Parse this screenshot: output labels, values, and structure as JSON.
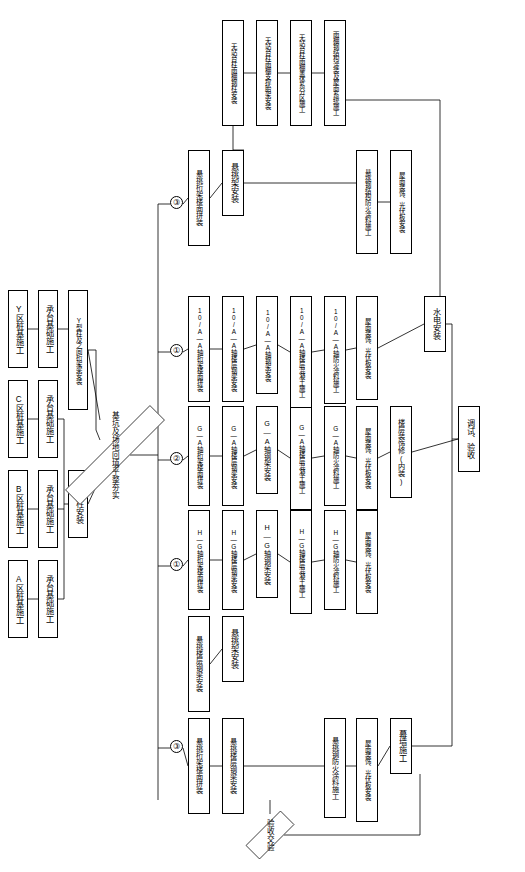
{
  "diagram": {
    "nodes": [
      {
        "id": "n1",
        "label": "A区桩基施工",
        "x": 8,
        "y": 560,
        "w": 20,
        "h": 78
      },
      {
        "id": "n2",
        "label": "承台基础施工",
        "x": 38,
        "y": 560,
        "w": 20,
        "h": 78
      },
      {
        "id": "n3",
        "label": "B区桩基施工",
        "x": 8,
        "y": 470,
        "w": 20,
        "h": 78
      },
      {
        "id": "n4",
        "label": "承台基础施工",
        "x": 38,
        "y": 470,
        "w": 20,
        "h": 78
      },
      {
        "id": "n5",
        "label": "C区桩基施工",
        "x": 8,
        "y": 380,
        "w": 20,
        "h": 78
      },
      {
        "id": "n6",
        "label": "承台基础施工",
        "x": 38,
        "y": 380,
        "w": 20,
        "h": 78
      },
      {
        "id": "n7",
        "label": "Y区桩基施工",
        "x": 8,
        "y": 290,
        "w": 20,
        "h": 78
      },
      {
        "id": "n8",
        "label": "承台基础施工",
        "x": 38,
        "y": 290,
        "w": 20,
        "h": 78
      },
      {
        "id": "n9",
        "label": "钢管柱安装",
        "x": 68,
        "y": 470,
        "w": 20,
        "h": 68
      },
      {
        "id": "n10",
        "label": "Y型柱及之间桁架梁安装",
        "x": 68,
        "y": 290,
        "w": 20,
        "h": 120
      },
      {
        "id": "n11",
        "label": "悬挑桁架楼面拼装",
        "x": 188,
        "y": 718,
        "w": 22,
        "h": 96
      },
      {
        "id": "n12",
        "label": "悬挑楼层钢梁安装",
        "x": 188,
        "y": 616,
        "w": 22,
        "h": 96
      },
      {
        "id": "n13",
        "label": "H—G轴桁架楼面拼装",
        "x": 188,
        "y": 510,
        "w": 22,
        "h": 100
      },
      {
        "id": "n14",
        "label": "G—A轴桁架楼面拼装",
        "x": 188,
        "y": 406,
        "w": 22,
        "h": 100
      },
      {
        "id": "n15",
        "label": "10/A—A轴桁架楼面拼装",
        "x": 188,
        "y": 296,
        "w": 22,
        "h": 106
      },
      {
        "id": "n16",
        "label": "悬挑桁架楼面拼装",
        "x": 188,
        "y": 150,
        "w": 22,
        "h": 96
      },
      {
        "id": "n17",
        "label": "悬挑楼层钢梁安装",
        "x": 222,
        "y": 718,
        "w": 22,
        "h": 96
      },
      {
        "id": "n18",
        "label": "悬挑架安装",
        "x": 222,
        "y": 616,
        "w": 22,
        "h": 66
      },
      {
        "id": "n19",
        "label": "H—G轴楼层钢梁安装",
        "x": 222,
        "y": 510,
        "w": 22,
        "h": 100
      },
      {
        "id": "n20",
        "label": "G—A轴楼层钢梁安装",
        "x": 222,
        "y": 406,
        "w": 22,
        "h": 100
      },
      {
        "id": "n21",
        "label": "10/A—A轴楼层钢梁安装",
        "x": 222,
        "y": 296,
        "w": 22,
        "h": 106
      },
      {
        "id": "n22",
        "label": "悬挑架安装",
        "x": 222,
        "y": 150,
        "w": 22,
        "h": 66
      },
      {
        "id": "n23",
        "label": "H—G轴钢架安装",
        "x": 256,
        "y": 510,
        "w": 22,
        "h": 88
      },
      {
        "id": "n24",
        "label": "G—A轴钢架安装",
        "x": 256,
        "y": 406,
        "w": 22,
        "h": 88
      },
      {
        "id": "n25",
        "label": "10/A—A轴钢架安装",
        "x": 256,
        "y": 296,
        "w": 22,
        "h": 98
      },
      {
        "id": "n26",
        "label": "H—G轴楼层混凝土施工",
        "x": 290,
        "y": 510,
        "w": 22,
        "h": 104
      },
      {
        "id": "n27",
        "label": "G—A轴楼层混凝土施工",
        "x": 290,
        "y": 406,
        "w": 22,
        "h": 104
      },
      {
        "id": "n28",
        "label": "10/A—A轴楼层混凝土施工",
        "x": 290,
        "y": 296,
        "w": 22,
        "h": 112
      },
      {
        "id": "n29",
        "label": "悬挑钢结构防火涂料施工",
        "x": 356,
        "y": 150,
        "w": 22,
        "h": 104
      },
      {
        "id": "n30",
        "label": "H—G轴防火涂料施工",
        "x": 324,
        "y": 510,
        "w": 22,
        "h": 100
      },
      {
        "id": "n31",
        "label": "G—A轴防火涂料施工",
        "x": 324,
        "y": 406,
        "w": 22,
        "h": 100
      },
      {
        "id": "n32",
        "label": "10/A—A轴防火涂料施工",
        "x": 324,
        "y": 296,
        "w": 22,
        "h": 108
      },
      {
        "id": "n33",
        "label": "悬挑钢防火涂料施工",
        "x": 324,
        "y": 718,
        "w": 22,
        "h": 100
      },
      {
        "id": "n34",
        "label": "屋面装饰、光伏板安装",
        "x": 356,
        "y": 718,
        "w": 22,
        "h": 104
      },
      {
        "id": "n35",
        "label": "屋面装饰、光伏板安装",
        "x": 356,
        "y": 510,
        "w": 22,
        "h": 104
      },
      {
        "id": "n36",
        "label": "屋面装饰、光伏板安装",
        "x": 356,
        "y": 406,
        "w": 22,
        "h": 104
      },
      {
        "id": "n37",
        "label": "屋面装饰、光伏板安装",
        "x": 356,
        "y": 296,
        "w": 22,
        "h": 104
      },
      {
        "id": "n38",
        "label": "屋面装饰、光伏板安装",
        "x": 390,
        "y": 150,
        "w": 22,
        "h": 104
      },
      {
        "id": "n39",
        "label": "幕墙施工",
        "x": 390,
        "y": 718,
        "w": 22,
        "h": 56
      },
      {
        "id": "n40",
        "label": "楼层装饰修(内装)",
        "x": 390,
        "y": 406,
        "w": 22,
        "h": 92
      },
      {
        "id": "n41",
        "label": "水电安装",
        "x": 424,
        "y": 296,
        "w": 22,
        "h": 56
      },
      {
        "id": "n42",
        "label": "调试、验收",
        "x": 458,
        "y": 406,
        "w": 22,
        "h": 66
      },
      {
        "id": "n43",
        "label": "无站台柱雨棚钢柱安装",
        "x": 222,
        "y": 20,
        "w": 22,
        "h": 106
      },
      {
        "id": "n44",
        "label": "无站台柱雨棚支撑胎架安装",
        "x": 256,
        "y": 20,
        "w": 22,
        "h": 106
      },
      {
        "id": "n45",
        "label": "无站台柱雨棚盖体系分区施工",
        "x": 290,
        "y": 20,
        "w": 22,
        "h": 106
      },
      {
        "id": "n46",
        "label": "雨棚钢结构涂装及屋面系统施工",
        "x": 324,
        "y": 20,
        "w": 22,
        "h": 106
      }
    ],
    "diamonds": [
      {
        "id": "d1",
        "label": "基坑及场地回填平整夯实",
        "x": 100,
        "y": 370,
        "w": 30,
        "h": 170
      },
      {
        "id": "d2",
        "label": "验收交验",
        "x": 256,
        "y": 800,
        "w": 28,
        "h": 70
      }
    ],
    "circles": [
      {
        "id": "c1",
        "label": "③",
        "x": 170,
        "y": 740,
        "d": 13
      },
      {
        "id": "c2",
        "label": "①",
        "x": 170,
        "y": 558,
        "d": 13
      },
      {
        "id": "c3",
        "label": "②",
        "x": 170,
        "y": 452,
        "d": 13
      },
      {
        "id": "c4",
        "label": "①",
        "x": 170,
        "y": 344,
        "d": 13
      },
      {
        "id": "c5",
        "label": "③",
        "x": 170,
        "y": 196,
        "d": 13
      }
    ],
    "edges": [
      {
        "from": "n1",
        "to": "n2"
      },
      {
        "from": "n3",
        "to": "n4"
      },
      {
        "from": "n5",
        "to": "n6"
      },
      {
        "from": "n7",
        "to": "n8"
      },
      {
        "from": "n2",
        "to": "n9"
      },
      {
        "from": "n4",
        "to": "n9"
      },
      {
        "from": "n6",
        "to": "n9"
      },
      {
        "from": "n8",
        "to": "n10"
      },
      {
        "from": "n9",
        "to": "d1"
      },
      {
        "from": "n10",
        "to": "d1"
      },
      {
        "from": "n11",
        "to": "n17"
      },
      {
        "from": "n12",
        "to": "n18"
      },
      {
        "from": "n13",
        "to": "n19"
      },
      {
        "from": "n14",
        "to": "n20"
      },
      {
        "from": "n15",
        "to": "n21"
      },
      {
        "from": "n16",
        "to": "n22"
      },
      {
        "from": "n19",
        "to": "n23"
      },
      {
        "from": "n20",
        "to": "n24"
      },
      {
        "from": "n21",
        "to": "n25"
      },
      {
        "from": "n23",
        "to": "n26"
      },
      {
        "from": "n24",
        "to": "n27"
      },
      {
        "from": "n25",
        "to": "n28"
      },
      {
        "from": "n26",
        "to": "n30"
      },
      {
        "from": "n27",
        "to": "n31"
      },
      {
        "from": "n28",
        "to": "n32"
      },
      {
        "from": "n30",
        "to": "n35"
      },
      {
        "from": "n31",
        "to": "n36"
      },
      {
        "from": "n32",
        "to": "n37"
      },
      {
        "from": "n17",
        "to": "n33"
      },
      {
        "from": "n33",
        "to": "n34"
      },
      {
        "from": "n22",
        "to": "n29"
      },
      {
        "from": "n29",
        "to": "n38"
      },
      {
        "from": "n34",
        "to": "n39"
      },
      {
        "from": "n36",
        "to": "n40"
      },
      {
        "from": "n37",
        "to": "n41"
      },
      {
        "from": "n40",
        "to": "n42"
      },
      {
        "from": "n41",
        "to": "n42"
      },
      {
        "from": "n39",
        "to": "n42"
      },
      {
        "from": "n43",
        "to": "n44"
      },
      {
        "from": "n44",
        "to": "n45"
      },
      {
        "from": "n45",
        "to": "n46"
      }
    ]
  }
}
